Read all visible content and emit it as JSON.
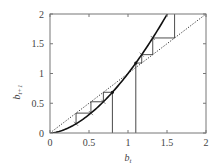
{
  "chart_data": {
    "type": "line",
    "title": "",
    "xlabel": "b_t",
    "ylabel": "b_{t+1}",
    "xlim": [
      0,
      2
    ],
    "ylim": [
      0,
      2
    ],
    "x_ticks": [
      "0",
      "0.5",
      "1",
      "1.5",
      "2"
    ],
    "y_ticks": [
      "0",
      "0.5",
      "1",
      "1.5",
      "2"
    ],
    "grid": false,
    "legend": "none",
    "series": [
      {
        "name": "map curve b_{t+1} = f(b_t)",
        "style": "solid",
        "x": [
          0,
          0.2,
          0.4,
          0.6,
          0.8,
          1.0,
          1.1,
          1.2,
          1.3,
          1.4,
          1.5
        ],
        "y": [
          0,
          0.065,
          0.21,
          0.42,
          0.68,
          1.0,
          1.18,
          1.36,
          1.56,
          1.77,
          1.99
        ]
      },
      {
        "name": "45-degree line b_{t+1} = b_t",
        "style": "dotted",
        "x": [
          0,
          2
        ],
        "y": [
          0,
          2
        ]
      },
      {
        "name": "cobweb from b_0 = 0.8 (converging toward 0)",
        "style": "solid-thin",
        "start": 0.8
      },
      {
        "name": "cobweb from b_0 = 1.1 (diverging)",
        "style": "solid-thin",
        "start": 1.1
      }
    ],
    "annotations": [
      {
        "type": "vline",
        "x": 0.8,
        "from_y": 0,
        "to_y": 0.68
      },
      {
        "type": "vline",
        "x": 1.1,
        "from_y": 0,
        "to_y": 1.18
      }
    ]
  }
}
